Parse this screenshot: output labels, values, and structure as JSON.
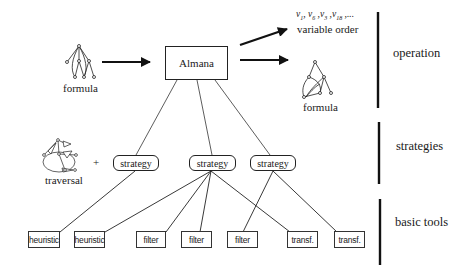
{
  "diagram": {
    "type": "architecture-flow",
    "input": {
      "label": "formula",
      "icon": "formula-tree-icon"
    },
    "core": {
      "label": "Almana"
    },
    "outputs": [
      {
        "sequence": "v1, v6, v3, v18, ...",
        "sequence_items": [
          "v",
          "1",
          ", v",
          "6",
          " ,v",
          "3",
          " ,v",
          "18",
          " ,..."
        ],
        "label": "variable order"
      },
      {
        "label": "formula",
        "icon": "formula-dag-icon"
      }
    ],
    "traversal": {
      "label": "traversal",
      "icon": "traversal-graph-icon",
      "plus": "+"
    },
    "strategies": [
      {
        "label": "strategy"
      },
      {
        "label": "strategy"
      },
      {
        "label": "strategy"
      }
    ],
    "tools": [
      {
        "label": "heuristic"
      },
      {
        "label": "heuristic"
      },
      {
        "label": "filter"
      },
      {
        "label": "filter"
      },
      {
        "label": "filter"
      },
      {
        "label": "transf."
      },
      {
        "label": "transf."
      }
    ],
    "connections": {
      "almana_to_strategies": [
        0,
        1,
        2
      ],
      "strategy_0": [
        "tool_0"
      ],
      "strategy_1": [
        "tool_1",
        "tool_2",
        "tool_3",
        "tool_5"
      ],
      "strategy_2": [
        "tool_4",
        "tool_6"
      ]
    },
    "layers": [
      {
        "label": "operation"
      },
      {
        "label": "strategies"
      },
      {
        "label": "basic tools"
      }
    ]
  }
}
